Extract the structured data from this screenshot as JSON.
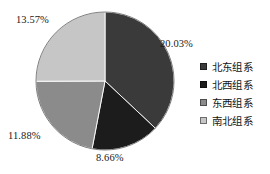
{
  "chart_data": {
    "type": "pie",
    "title": "",
    "subtitle": "",
    "xlabel": "",
    "ylabel": "",
    "grid": false,
    "legend_position": "right",
    "start_angle_deg": 0,
    "direction": "clockwise",
    "categories": [
      "北东组系",
      "北西组系",
      "东西组系",
      "南北组系"
    ],
    "values": [
      20.03,
      8.66,
      11.88,
      13.57
    ],
    "value_labels": [
      "20.03%",
      "8.66%",
      "11.88%",
      "13.57%"
    ],
    "colors": [
      "#3a3a3a",
      "#1c1c1c",
      "#8b8b8b",
      "#c6c6c6"
    ],
    "slice_angles_deg": [
      133.2,
      57.6,
      79.0,
      90.2
    ]
  },
  "labels": {
    "slice_0": "20.03%",
    "slice_1": "8.66%",
    "slice_2": "11.88%",
    "slice_3": "13.57%"
  },
  "legend": {
    "items": [
      {
        "label": "北东组系",
        "color": "#3a3a3a"
      },
      {
        "label": "北西组系",
        "color": "#1c1c1c"
      },
      {
        "label": "东西组系",
        "color": "#8b8b8b"
      },
      {
        "label": "南北组系",
        "color": "#c6c6c6"
      }
    ]
  }
}
